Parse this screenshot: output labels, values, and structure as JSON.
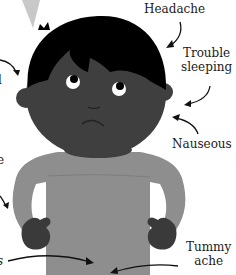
{
  "illustration": {
    "subject": "child with symptoms",
    "colors": {
      "background": "#ffffff",
      "hair": "#000000",
      "skin": "#3f3f3f",
      "shirt": "#8e8e8e",
      "mittens": "#3a3a3a",
      "eye_white": "#ffffff",
      "pupil": "#000000",
      "arrow": "#111111",
      "light_ray": "#c8c8c8"
    }
  },
  "labels": {
    "headache": "Headache",
    "trouble_sleeping_line1": "Trouble",
    "trouble_sleeping_line2": "sleeping",
    "nauseous": "Nauseous",
    "tummy_ache_line1": "Tummy",
    "tummy_ache_line2": "ache",
    "left_fragment_1": "l",
    "left_fragment_2": "e",
    "left_fragment_3": "s"
  }
}
